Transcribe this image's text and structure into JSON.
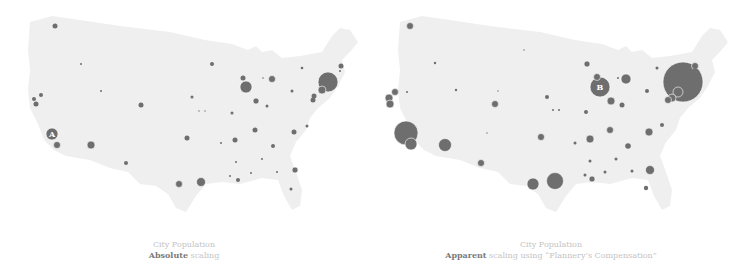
{
  "colors": {
    "land": "#efefef",
    "bubble": "#6e6e6e",
    "bubble_stroke": "#ffffff",
    "caption": "#c4c4c4",
    "caption_strong": "#7a7a7a"
  },
  "chart_data": [
    {
      "type": "bubble-map",
      "title": "City Population",
      "subtitle_strong": "Absolute",
      "subtitle_rest": " scaling",
      "label_marker": {
        "text": "A",
        "x": 52,
        "y": 134
      },
      "points": [
        [
          55,
          26,
          2.5
        ],
        [
          81,
          64,
          1
        ],
        [
          212,
          64,
          2
        ],
        [
          243,
          78,
          2.5
        ],
        [
          246,
          87,
          6
        ],
        [
          272,
          79,
          3.5
        ],
        [
          263,
          78,
          0.8
        ],
        [
          302,
          68,
          1.3
        ],
        [
          341,
          66,
          2.5
        ],
        [
          340,
          71,
          1
        ],
        [
          328,
          82,
          10
        ],
        [
          322,
          90,
          4
        ],
        [
          314,
          96,
          2.5
        ],
        [
          313,
          100,
          2.5
        ],
        [
          292,
          91,
          1.5
        ],
        [
          256,
          101,
          3
        ],
        [
          267,
          106,
          1.5
        ],
        [
          232,
          113,
          1.5
        ],
        [
          192,
          97,
          1.5
        ],
        [
          199,
          111,
          0.7
        ],
        [
          205,
          111,
          0.7
        ],
        [
          101,
          91,
          1
        ],
        [
          141,
          105,
          2.5
        ],
        [
          41,
          95,
          2
        ],
        [
          34,
          99,
          2
        ],
        [
          36,
          104,
          2.5
        ],
        [
          52,
          134,
          6
        ],
        [
          57,
          145,
          3.5
        ],
        [
          91,
          145,
          4
        ],
        [
          126,
          163,
          2
        ],
        [
          187,
          138,
          2.5
        ],
        [
          221,
          143,
          1
        ],
        [
          235,
          140,
          2.5
        ],
        [
          255,
          130,
          2.5
        ],
        [
          294,
          132,
          2.5
        ],
        [
          307,
          126,
          1.5
        ],
        [
          273,
          146,
          2
        ],
        [
          236,
          162,
          1
        ],
        [
          262,
          159,
          1
        ],
        [
          230,
          176,
          1
        ],
        [
          238,
          180,
          2
        ],
        [
          251,
          173,
          1
        ],
        [
          277,
          172,
          1
        ],
        [
          295,
          170,
          3
        ],
        [
          291,
          189,
          1.5
        ],
        [
          179,
          184,
          3.5
        ],
        [
          201,
          182,
          4.5
        ]
      ]
    },
    {
      "type": "bubble-map",
      "title": "City Population",
      "subtitle_strong": "Apparent",
      "subtitle_rest": " scaling using “Flannery’s Compensation”",
      "label_marker": {
        "text": "B",
        "x": 230,
        "y": 87
      },
      "points": [
        [
          40,
          26,
          3.5
        ],
        [
          65,
          63,
          1.2
        ],
        [
          154,
          50,
          0.7
        ],
        [
          217,
          64,
          3
        ],
        [
          227,
          77,
          3.5
        ],
        [
          230,
          87,
          10
        ],
        [
          256,
          79,
          5
        ],
        [
          248,
          78,
          1
        ],
        [
          287,
          68,
          1.5
        ],
        [
          325,
          66,
          3.5
        ],
        [
          325,
          70,
          2
        ],
        [
          313,
          82,
          20
        ],
        [
          308,
          92,
          5
        ],
        [
          302,
          98,
          4
        ],
        [
          298,
          100,
          3.5
        ],
        [
          277,
          91,
          2
        ],
        [
          241,
          101,
          4
        ],
        [
          252,
          105,
          2.5
        ],
        [
          216,
          112,
          2
        ],
        [
          177,
          97,
          2
        ],
        [
          183,
          110,
          1
        ],
        [
          189,
          110,
          1
        ],
        [
          86,
          90,
          1.2
        ],
        [
          128,
          91,
          0.7
        ],
        [
          125,
          104,
          3.5
        ],
        [
          25,
          92,
          3.5
        ],
        [
          19,
          98,
          4
        ],
        [
          20,
          104,
          4
        ],
        [
          36,
          133,
          12
        ],
        [
          41,
          144,
          6
        ],
        [
          75,
          145,
          6.5
        ],
        [
          111,
          163,
          3.5
        ],
        [
          171,
          137,
          3.5
        ],
        [
          205,
          143,
          1.5
        ],
        [
          220,
          139,
          4
        ],
        [
          240,
          130,
          3.5
        ],
        [
          279,
          132,
          4
        ],
        [
          292,
          125,
          2
        ],
        [
          258,
          146,
          2.8
        ],
        [
          220,
          161,
          1.5
        ],
        [
          246,
          159,
          1.5
        ],
        [
          215,
          175,
          1.5
        ],
        [
          222,
          179,
          3
        ],
        [
          235,
          172,
          1.5
        ],
        [
          262,
          171,
          1.5
        ],
        [
          280,
          170,
          4.5
        ],
        [
          276,
          188,
          2.2
        ],
        [
          163,
          184,
          6
        ],
        [
          185,
          181,
          8.5
        ],
        [
          117,
          133,
          0.7
        ],
        [
          37,
          92,
          1
        ]
      ]
    }
  ],
  "panels": {
    "left": {
      "caption_line1": "City Population",
      "caption_strong": "Absolute",
      "caption_rest": " scaling",
      "marker": "A"
    },
    "right": {
      "caption_line1": "City Population",
      "caption_strong": "Apparent",
      "caption_rest": " scaling using “Flannery’s Compensation”",
      "marker": "B"
    }
  }
}
